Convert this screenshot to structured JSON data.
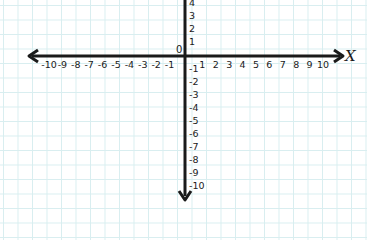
{
  "chart_data": {
    "type": "coordinate-plane",
    "title": "",
    "xlabel": "X",
    "ylabel": "",
    "xlim": [
      -10,
      10
    ],
    "ylim": [
      -10,
      4
    ],
    "grid": true,
    "x_ticks": [
      "-10",
      "-9",
      "-8",
      "-7",
      "-6",
      "-5",
      "-4",
      "-3",
      "-2",
      "-1",
      "1",
      "2",
      "3",
      "4",
      "5",
      "6",
      "7",
      "8",
      "9",
      "10"
    ],
    "y_ticks_positive": [
      "4",
      "3",
      "2",
      "1"
    ],
    "y_ticks_negative": [
      "-1",
      "-2",
      "-3",
      "-4",
      "-5",
      "-6",
      "-7",
      "-8",
      "-9",
      "-10"
    ],
    "origin_label": "0"
  },
  "colors": {
    "axis": "#1a1a1a",
    "grid": "#d8eef0",
    "background": "#ffffff"
  }
}
